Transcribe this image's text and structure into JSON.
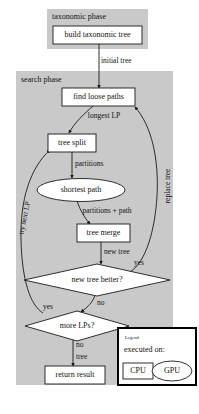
{
  "diagram": {
    "colors": {
      "phase_background": "#c9c9c9",
      "node_fill": "#ffffff",
      "stroke": "#1a1a1a",
      "legend_border": "#000000",
      "page_background": "#ffffff"
    },
    "phases": [
      {
        "id": "taxonomic",
        "label": "taxonomic phase"
      },
      {
        "id": "search",
        "label": "search phase"
      }
    ],
    "nodes": [
      {
        "id": "build_tree",
        "label": "build taxonomic tree",
        "shape": "rect",
        "device": "CPU"
      },
      {
        "id": "find_loose_paths",
        "label": "find loose paths",
        "shape": "rect",
        "device": "CPU"
      },
      {
        "id": "tree_split",
        "label": "tree split",
        "shape": "rect",
        "device": "CPU"
      },
      {
        "id": "shortest_path",
        "label": "shortest path",
        "shape": "ellipse",
        "device": "GPU"
      },
      {
        "id": "tree_merge",
        "label": "tree merge",
        "shape": "rect",
        "device": "CPU"
      },
      {
        "id": "new_tree_better",
        "label": "new tree better?",
        "shape": "diamond",
        "device": "CPU"
      },
      {
        "id": "more_lps",
        "label": "more LPs?",
        "shape": "diamond",
        "device": "CPU"
      },
      {
        "id": "return_result",
        "label": "return result",
        "shape": "rect",
        "device": "CPU"
      }
    ],
    "edges": [
      {
        "id": "e_initial_tree",
        "from": "build_tree",
        "to": "find_loose_paths",
        "label": "initial tree"
      },
      {
        "id": "e_longest_lp",
        "from": "find_loose_paths",
        "to": "tree_split",
        "label": "longest LP"
      },
      {
        "id": "e_partitions",
        "from": "tree_split",
        "to": "shortest_path",
        "label": "partitions"
      },
      {
        "id": "e_partitions_path",
        "from": "shortest_path",
        "to": "tree_merge",
        "label": "partitions + path"
      },
      {
        "id": "e_new_tree",
        "from": "tree_merge",
        "to": "new_tree_better",
        "label": "new tree"
      },
      {
        "id": "e_yes_replace",
        "from": "new_tree_better",
        "to": "find_loose_paths",
        "label": "yes"
      },
      {
        "id": "e_replace_tree",
        "from": "new_tree_better",
        "to": "find_loose_paths",
        "label": "replace tree"
      },
      {
        "id": "e_no_more_lps",
        "from": "new_tree_better",
        "to": "more_lps",
        "label": "no"
      },
      {
        "id": "e_yes_try_next",
        "from": "more_lps",
        "to": "tree_split",
        "label": "yes"
      },
      {
        "id": "e_try_next_lp",
        "from": "more_lps",
        "to": "tree_split",
        "label": "try next LP"
      },
      {
        "id": "e_no_return",
        "from": "more_lps",
        "to": "return_result",
        "label": "no"
      },
      {
        "id": "e_tree_return",
        "from": "more_lps",
        "to": "return_result",
        "label": "tree"
      }
    ],
    "legend": {
      "title": "Legend",
      "caption": "executed on:",
      "items": [
        {
          "id": "cpu",
          "label": "CPU",
          "shape": "rect"
        },
        {
          "id": "gpu",
          "label": "GPU",
          "shape": "ellipse"
        }
      ]
    }
  }
}
